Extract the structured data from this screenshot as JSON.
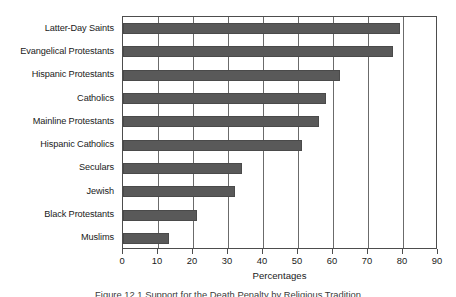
{
  "chart_data": {
    "type": "bar",
    "orientation": "horizontal",
    "title": "",
    "xlabel": "Percentages",
    "ylabel": "",
    "xlim": [
      0,
      90
    ],
    "xticks": [
      0,
      10,
      20,
      30,
      40,
      50,
      60,
      70,
      80,
      90
    ],
    "grid": "vertical",
    "legend": null,
    "bar_color": "#595959",
    "frame_color": "#4d4d4d",
    "categories": [
      "Latter-Day Saints",
      "Evangelical Protestants",
      "Hispanic Protestants",
      "Catholics",
      "Mainline Protestants",
      "Hispanic Catholics",
      "Seculars",
      "Jewish",
      "Black Protestants",
      "Muslims"
    ],
    "values": [
      79,
      77,
      62,
      58,
      56,
      51,
      34,
      32,
      21,
      13
    ]
  },
  "caption": {
    "text": "Figure 12.1  Support for the Death Penalty by Religious Tradition"
  }
}
